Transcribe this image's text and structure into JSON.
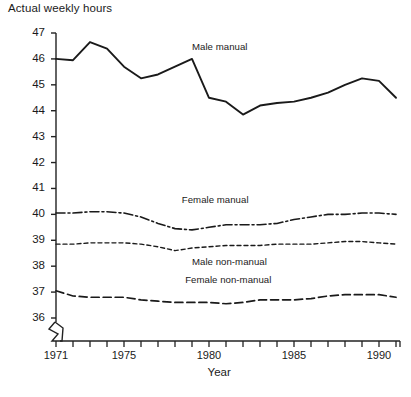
{
  "chart_data": {
    "type": "line",
    "title": "Actual weekly hours",
    "xlabel": "Year",
    "ylabel": "Actual weekly hours",
    "ylim": [
      36,
      47
    ],
    "xlim": [
      1971,
      1991
    ],
    "grid": false,
    "legend_position": "inline-annotations",
    "y_ticks": [
      "47",
      "46",
      "45",
      "44",
      "43",
      "42",
      "41",
      "40",
      "39",
      "38",
      "37",
      "36"
    ],
    "x_ticks": [
      "1971",
      "1975",
      "1980",
      "1985",
      "1990"
    ],
    "x_tick_years": [
      1971,
      1972,
      1973,
      1974,
      1975,
      1976,
      1977,
      1978,
      1979,
      1980,
      1981,
      1982,
      1983,
      1984,
      1985,
      1986,
      1987,
      1988,
      1989,
      1990,
      1991
    ],
    "y_axis_break": true,
    "x": [
      1971,
      1972,
      1973,
      1974,
      1975,
      1976,
      1977,
      1978,
      1979,
      1980,
      1981,
      1982,
      1983,
      1984,
      1985,
      1986,
      1987,
      1988,
      1989,
      1990,
      1991
    ],
    "series": [
      {
        "name": "Male manual",
        "style": "solid",
        "values": [
          46.0,
          45.95,
          46.65,
          46.4,
          45.7,
          45.25,
          45.4,
          45.7,
          46.0,
          44.5,
          44.35,
          43.85,
          44.2,
          44.3,
          44.35,
          44.5,
          44.7,
          45.0,
          45.25,
          45.15,
          44.5
        ]
      },
      {
        "name": "Female manual",
        "style": "dash-dot",
        "values": [
          40.05,
          40.05,
          40.1,
          40.1,
          40.05,
          39.9,
          39.65,
          39.45,
          39.4,
          39.5,
          39.6,
          39.6,
          39.6,
          39.65,
          39.8,
          39.9,
          40.0,
          40.0,
          40.05,
          40.05,
          40.0
        ]
      },
      {
        "name": "Male non-manual",
        "style": "dotted",
        "values": [
          38.85,
          38.85,
          38.9,
          38.9,
          38.9,
          38.85,
          38.75,
          38.6,
          38.7,
          38.75,
          38.8,
          38.8,
          38.8,
          38.85,
          38.85,
          38.85,
          38.9,
          38.95,
          38.95,
          38.9,
          38.85
        ]
      },
      {
        "name": "Female non-manual",
        "style": "dashed",
        "values": [
          37.05,
          36.85,
          36.8,
          36.8,
          36.8,
          36.7,
          36.65,
          36.6,
          36.6,
          36.6,
          36.55,
          36.6,
          36.7,
          36.7,
          36.7,
          36.75,
          36.85,
          36.9,
          36.9,
          36.9,
          36.8
        ]
      }
    ],
    "annotations": [
      {
        "text": "Male manual",
        "x": 1979.0,
        "y": 46.45
      },
      {
        "text": "Female manual",
        "x": 1978.4,
        "y": 40.55
      },
      {
        "text": "Male non-manual",
        "x": 1979.0,
        "y": 38.15
      },
      {
        "text": "Female non-manual",
        "x": 1978.6,
        "y": 37.45
      }
    ]
  }
}
